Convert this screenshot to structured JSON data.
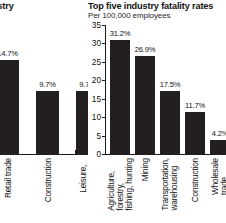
{
  "charts": {
    "left": {
      "title": "...ries, by industry",
      "subtitle": "...t",
      "type": "bar",
      "note": "left chart is cropped at the left edge of the screenshot",
      "ylabel": "",
      "xlabel": "",
      "categories": [
        "",
        "Retail trade",
        "Construction",
        "Leisure, hospitality"
      ],
      "values": [
        null,
        14.7,
        9.7,
        9.7
      ],
      "value_labels": [
        "%",
        "14.7%",
        "9.7%",
        "9.7%"
      ],
      "ylim": [
        0,
        20
      ],
      "grid": false
    },
    "right": {
      "title": "Top five industry fatality rates",
      "subtitle": "Per 100,000 employees",
      "type": "bar",
      "ylabel": "",
      "xlabel": "",
      "categories": [
        "Agriculture, forestry, fishing, hunting",
        "Mining",
        "Transportation, warehousing",
        "Construction",
        "Wholesale trade"
      ],
      "category_lines": [
        [
          "Agriculture,",
          "forestry,",
          "fishing, hunting"
        ],
        [
          "Mining",
          "",
          ""
        ],
        [
          "Transportation,",
          "warehousing",
          ""
        ],
        [
          "Construction",
          "",
          ""
        ],
        [
          "Wholesale",
          "trade",
          ""
        ]
      ],
      "values": [
        31.2,
        26.9,
        17.5,
        11.7,
        4.2
      ],
      "value_labels": [
        "31.2%",
        "26.9%",
        "17.5%",
        "11.7%",
        "4.2%"
      ],
      "yticks": [
        0,
        5,
        10,
        15,
        20,
        25,
        30,
        35
      ],
      "ytick_labels": [
        "0",
        "5",
        "10",
        "15",
        "20",
        "25",
        "30",
        "35"
      ],
      "ylim": [
        0,
        35
      ],
      "grid": false
    }
  },
  "colors": {
    "bar": "#231f20",
    "axis": "#1a1a1a",
    "text": "#111111",
    "background": "#ffffff"
  }
}
